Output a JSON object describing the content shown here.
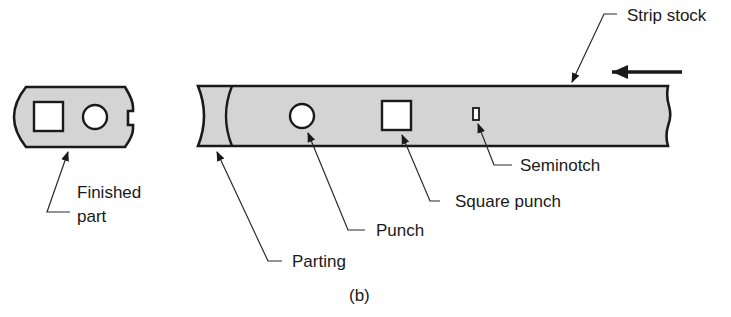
{
  "diagram": {
    "caption": "(b)",
    "labels": {
      "strip_stock": "Strip stock",
      "seminotch": "Seminotch",
      "square_punch": "Square punch",
      "punch": "Punch",
      "parting": "Parting",
      "finished_part_line1": "Finished",
      "finished_part_line2": "part"
    },
    "colors": {
      "stock_fill": "#d4d4d4",
      "outline": "#1a1a1a",
      "background": "#ffffff"
    },
    "feed_direction": "right-to-left"
  }
}
